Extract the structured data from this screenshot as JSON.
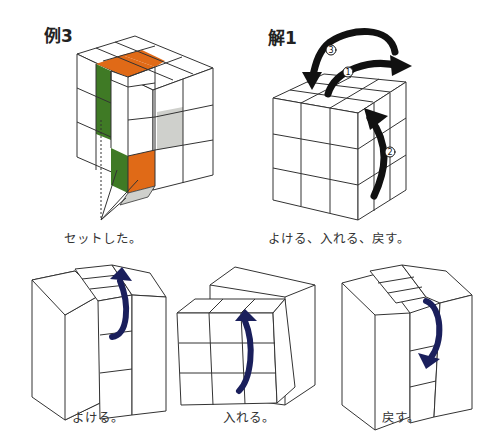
{
  "example": {
    "title": "例3",
    "caption": "セットした。",
    "colors": {
      "orange": "#e06a17",
      "green": "#3f7a25",
      "gray": "#cfd0cc",
      "line": "#333333"
    }
  },
  "solution": {
    "title": "解1",
    "caption": "よける、入れる、戻す。",
    "steps": [
      "①",
      "②",
      "③"
    ],
    "arrow_color": "#111111"
  },
  "steps_row": [
    {
      "caption": "よける。"
    },
    {
      "caption": "入れる。"
    },
    {
      "caption": "戻す。"
    }
  ],
  "step_arrow_color": "#1a1f5c"
}
